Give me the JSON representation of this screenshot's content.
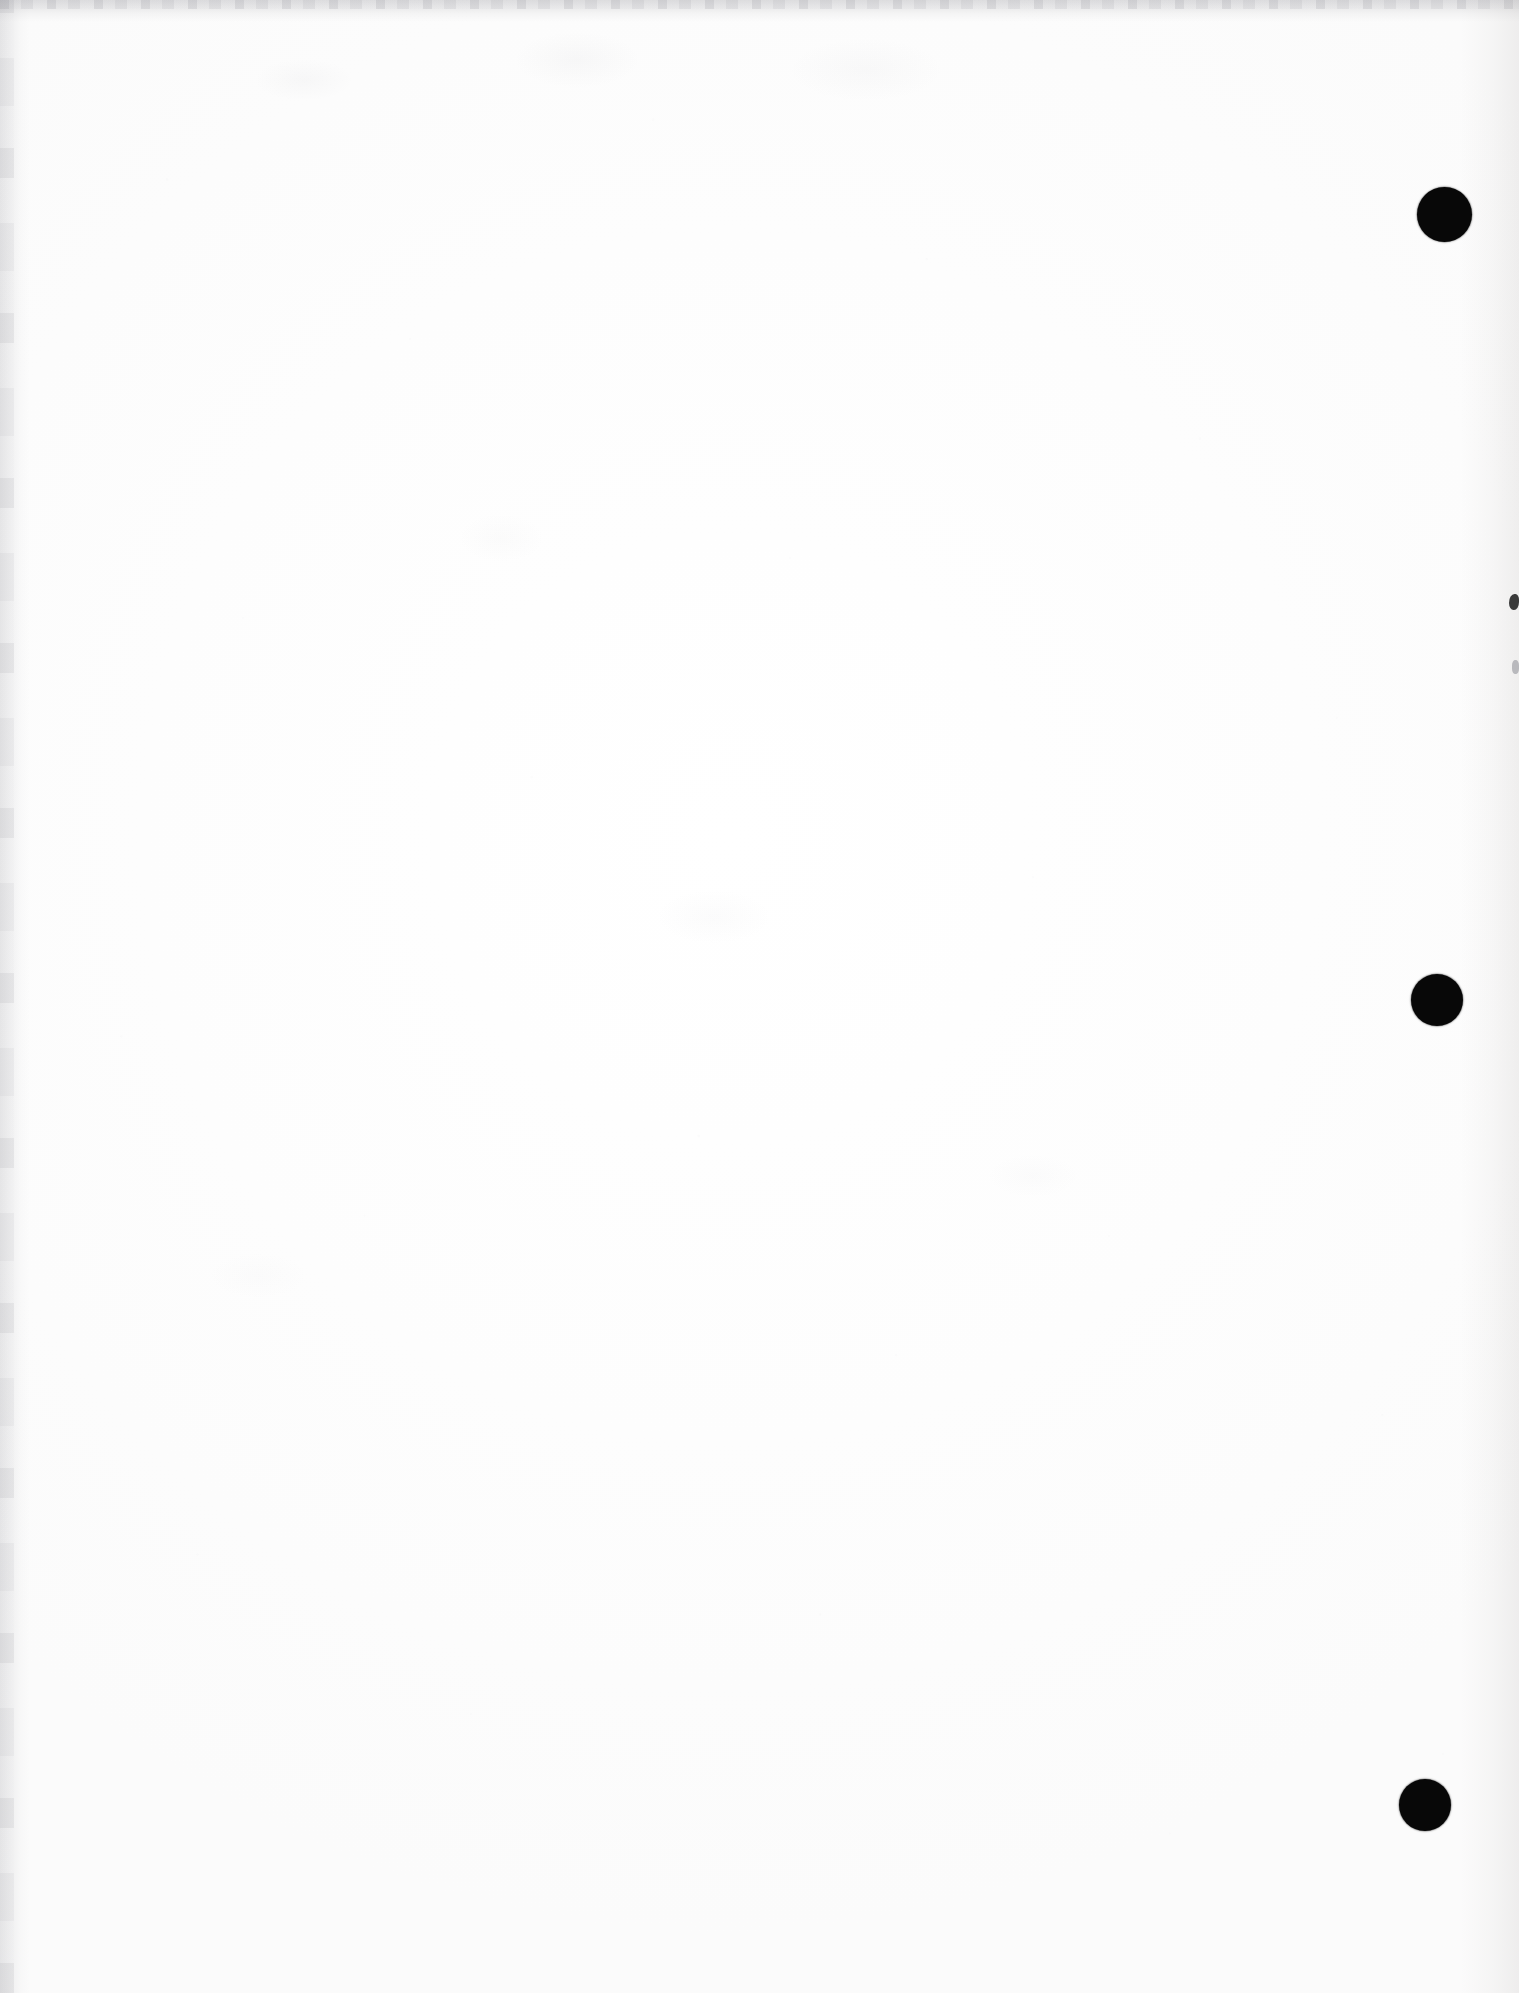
{
  "document": {
    "kind": "scanned-page",
    "state": "blank",
    "page_label": "",
    "orientation": "portrait",
    "width_px": 1519,
    "height_px": 1993,
    "text_content": "",
    "background_color": "#fdfdfd",
    "ink_color": "#080808",
    "scan_edge_color": "#96969c"
  },
  "binder_holes": {
    "count": 3,
    "color": "#080808",
    "margin_side": "right",
    "items": [
      {
        "label": "top-hole",
        "cx": 1444,
        "cy": 214,
        "d": 55
      },
      {
        "label": "middle-hole",
        "cx": 1437,
        "cy": 1000,
        "d": 52
      },
      {
        "label": "bottom-hole",
        "cx": 1425,
        "cy": 1805,
        "d": 52
      }
    ]
  },
  "edge_marks": [
    {
      "label": "right-edge-nick-upper",
      "x": 1509,
      "y": 594,
      "w": 10,
      "h": 16,
      "color": "#3a3a3a"
    },
    {
      "label": "right-edge-nick-lower",
      "x": 1512,
      "y": 660,
      "w": 7,
      "h": 14,
      "color": "#b9b9bd"
    }
  ],
  "scan_artifacts": {
    "top_band": "grey bleed along top edge",
    "left_band": "grey bleed along left edge",
    "right_band": "faint warm-grey mottling along right edge",
    "grain": "fine paper speckle across sheet"
  }
}
